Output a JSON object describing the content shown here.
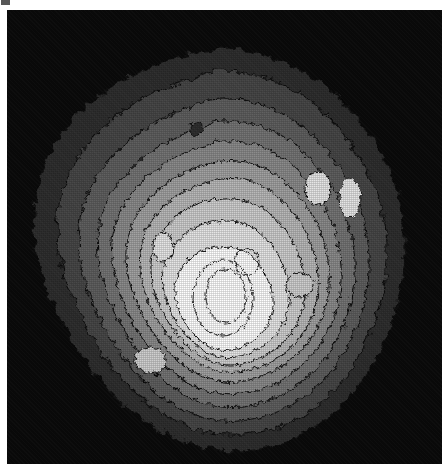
{
  "window": {
    "corner_fragment": "window-chrome-fragment"
  },
  "figure": {
    "title": "",
    "background_color": "#ffffff",
    "plot_background_color": "#0a0a0a",
    "contour_line_color": "#111111",
    "render_style": "halftone-dithered-grayscale-filled-contour",
    "x_px": 7,
    "y_px": 10,
    "width_px": 435,
    "height_px": 454
  },
  "chart_data": {
    "type": "heatmap",
    "subtype": "filled-contour",
    "title": "",
    "xlabel": "",
    "ylabel": "",
    "colormap": "grayscale",
    "grid": false,
    "legend": "none",
    "axes_visible": false,
    "tick_labels": [],
    "xlim": [
      0,
      435
    ],
    "ylim": [
      0,
      454
    ],
    "n_levels": 11,
    "level_values": [
      0,
      1,
      2,
      3,
      4,
      5,
      6,
      7,
      8,
      9,
      10
    ],
    "level_colors": [
      "#0a0a0a",
      "#2e2e2e",
      "#474747",
      "#5e5e5e",
      "#747474",
      "#8b8b8b",
      "#a2a2a2",
      "#b9b9b9",
      "#cfcfcf",
      "#e6e6e6",
      "#ffffff"
    ],
    "level_labels": [
      "level-0-background",
      "level-1",
      "level-2",
      "level-3",
      "level-4",
      "level-5",
      "level-6",
      "level-7",
      "level-8",
      "level-9",
      "level-10-peak"
    ],
    "peak_center_px": [
      218,
      300
    ],
    "blob_extent_px": {
      "x_min": 28,
      "x_max": 398,
      "y_min": 46,
      "y_max": 440
    },
    "islands": [
      {
        "name": "upper-right-island-a",
        "center_px": [
          318,
          188
        ],
        "level": 9
      },
      {
        "name": "upper-right-island-b",
        "center_px": [
          350,
          198
        ],
        "level": 9
      },
      {
        "name": "left-island",
        "center_px": [
          163,
          247
        ],
        "level": 9
      },
      {
        "name": "mid-right-island",
        "center_px": [
          300,
          285
        ],
        "level": 8
      },
      {
        "name": "low-island",
        "center_px": [
          150,
          360
        ],
        "level": 8
      },
      {
        "name": "upper-notch-island",
        "center_px": [
          196,
          128
        ],
        "level": 2
      }
    ]
  }
}
